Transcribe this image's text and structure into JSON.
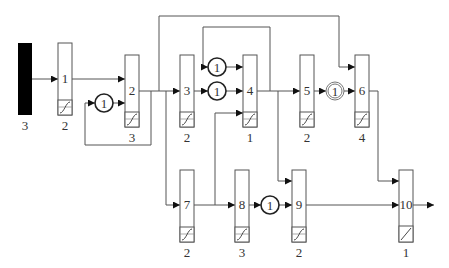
{
  "diagram": {
    "type": "block-flow-network",
    "source": {
      "fill": "#000000",
      "label": "3"
    },
    "blocks": [
      {
        "id": "1",
        "label": "1",
        "sub": "2"
      },
      {
        "id": "2",
        "label": "2",
        "sub": "3"
      },
      {
        "id": "3",
        "label": "3",
        "sub": "2"
      },
      {
        "id": "4",
        "label": "4",
        "sub": "1"
      },
      {
        "id": "5",
        "label": "5",
        "sub": "2"
      },
      {
        "id": "6",
        "label": "6",
        "sub": "4"
      },
      {
        "id": "7",
        "label": "7",
        "sub": "2"
      },
      {
        "id": "8",
        "label": "8",
        "sub": "3"
      },
      {
        "id": "9",
        "label": "9",
        "sub": "2"
      },
      {
        "id": "10",
        "label": "10",
        "sub": "1"
      }
    ],
    "delays": [
      {
        "id": "d_1_2",
        "label": "1",
        "style": "single"
      },
      {
        "id": "d_top_4",
        "label": "1",
        "style": "single"
      },
      {
        "id": "d_3_4",
        "label": "1",
        "style": "single"
      },
      {
        "id": "d_5_6",
        "label": "1",
        "style": "double"
      },
      {
        "id": "d_8_9",
        "label": "1",
        "style": "single"
      }
    ],
    "edges": [
      [
        "source",
        "1"
      ],
      [
        "1",
        "2"
      ],
      [
        "2",
        "d_1_2 (feedback)"
      ],
      [
        "d_1_2",
        "2"
      ],
      [
        "2",
        "3"
      ],
      [
        "2",
        "6"
      ],
      [
        "2",
        "7"
      ],
      [
        "3",
        "d_3_4"
      ],
      [
        "d_3_4",
        "4"
      ],
      [
        "4",
        "d_top_4 (feedback)"
      ],
      [
        "d_top_4",
        "4"
      ],
      [
        "7",
        "8"
      ],
      [
        "7",
        "4"
      ],
      [
        "4",
        "5"
      ],
      [
        "4",
        "9"
      ],
      [
        "5",
        "d_5_6"
      ],
      [
        "d_5_6",
        "6"
      ],
      [
        "8",
        "d_8_9"
      ],
      [
        "d_8_9",
        "9"
      ],
      [
        "6",
        "10"
      ],
      [
        "9",
        "10"
      ],
      [
        "10",
        "output"
      ]
    ],
    "colors": {
      "line": "#555555",
      "arrow": "#111111",
      "source": "#000000",
      "text": "#333333"
    }
  }
}
